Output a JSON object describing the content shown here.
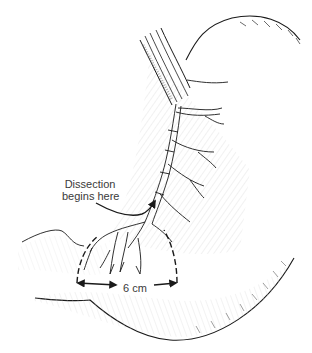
{
  "figure": {
    "annotations": {
      "dissection_start": {
        "line1": "Dissection",
        "line2": "begins here"
      },
      "measurement": {
        "label": "6 cm"
      }
    },
    "colors": {
      "ink": "#1a1a1a",
      "hatch": "#9a9a9a",
      "text": "#3a3a3a",
      "background": "#ffffff"
    }
  }
}
